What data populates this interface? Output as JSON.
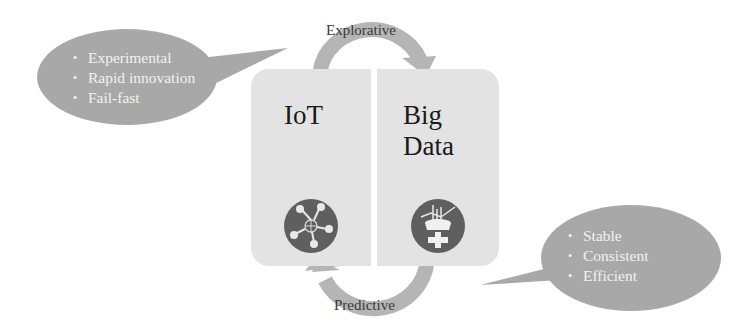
{
  "diagram": {
    "panels": [
      {
        "id": "iot",
        "title": "IoT",
        "icon": "iot-network-icon"
      },
      {
        "id": "big-data",
        "title_line1": "Big",
        "title_line2": "Data",
        "icon": "big-data-analytics-icon"
      }
    ],
    "arrows": {
      "top": {
        "label": "Explorative",
        "direction": "IoT → Big Data"
      },
      "bottom": {
        "label": "Predictive",
        "direction": "Big Data → IoT"
      }
    },
    "bubbles": {
      "left": {
        "bullet": "•",
        "items": [
          "Experimental",
          "Rapid innovation",
          "Fail-fast"
        ]
      },
      "right": {
        "bullet": "•",
        "items": [
          "Stable",
          "Consistent",
          "Efficient"
        ]
      }
    },
    "colors": {
      "panel": "#e3e3e3",
      "bubble": "#a8a8a8",
      "arrow": "#b5b5b5",
      "icon_circle": "#5f5f5f",
      "bubble_text": "#f2f2f2",
      "title_text": "#1a1a1a"
    }
  }
}
